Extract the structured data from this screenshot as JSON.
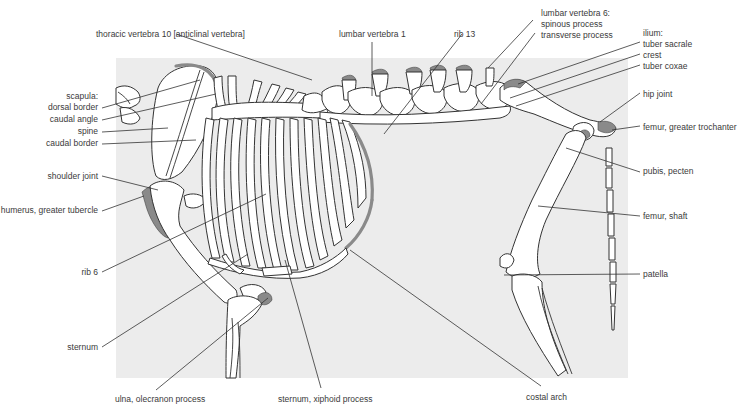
{
  "diagram": {
    "colors": {
      "background": "#ffffff",
      "panel": "#ececec",
      "bone_fill": "#ffffff",
      "bone_outline": "#333333",
      "highlight": "#8a8a8a",
      "label_text": "#3a3a3a"
    },
    "labels": {
      "thoracic_vertebra_10": "thoracic vertebra 10 [anticlinal vertebra]",
      "lumbar_vertebra_1": "lumbar vertebra 1",
      "rib_13": "rib 13",
      "lumbar_vertebra_6_title": "lumbar vertebra 6:",
      "lumbar_vertebra_6_spinous": "spinous process",
      "lumbar_vertebra_6_transverse": "transverse process",
      "ilium_title": "ilium:",
      "ilium_tuber_sacrale": "tuber sacrale",
      "ilium_crest": "crest",
      "ilium_tuber_coxae": "tuber coxae",
      "hip_joint": "hip joint",
      "femur_greater_trochanter": "femur, greater trochanter",
      "pubis_pecten": "pubis, pecten",
      "femur_shaft": "femur, shaft",
      "patella": "patella",
      "costal_arch": "costal arch",
      "sternum_xiphoid": "sternum, xiphoid process",
      "ulna_olecranon": "ulna, olecranon process",
      "sternum": "sternum",
      "rib_6": "rib 6",
      "humerus_greater_tubercle": "humerus, greater tubercle",
      "shoulder_joint": "shoulder joint",
      "scapula_title": "scapula:",
      "scapula_dorsal_border": "dorsal border",
      "scapula_caudal_angle": "caudal angle",
      "scapula_spine": "spine",
      "scapula_caudal_border": "caudal border"
    }
  }
}
